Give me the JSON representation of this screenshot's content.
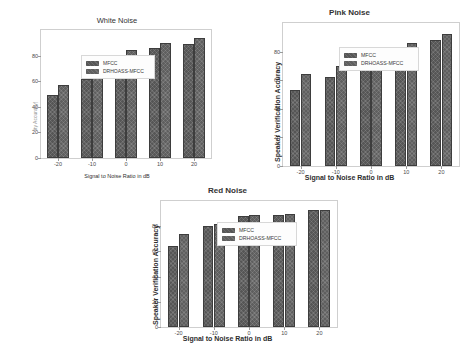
{
  "figure": {
    "background": "#ffffff",
    "bar_color_series1": "#565656",
    "bar_color_series2": "#5f5f5f"
  },
  "charts": [
    {
      "id": "chart1",
      "title": "White Noise",
      "title_bold": false,
      "xlabel": "Signal to Noise Ratio in dB",
      "xlabel_bold": false,
      "ylabel": "ity Accuracy)",
      "ylabel_bold": false,
      "ylabel_faint": true,
      "legend": [
        "MFCC",
        "DRHOASS-MFCC"
      ],
      "yticks": [
        "0",
        "20",
        "40",
        "60",
        "80"
      ],
      "xticks": [
        "-20",
        "-10",
        "0",
        "10",
        "20"
      ]
    },
    {
      "id": "chart2",
      "title": "Pink Noise",
      "title_bold": true,
      "xlabel": "Signal to Noise Ratio in dB",
      "xlabel_bold": true,
      "ylabel": "Speaker Verification Accuracy",
      "ylabel_bold": true,
      "ylabel_faint": false,
      "legend": [
        "MFCC",
        "DRHOASS-MFCC"
      ],
      "yticks": [
        "0",
        "20",
        "40",
        "60",
        "80"
      ],
      "xticks": [
        "-20",
        "-10",
        "0",
        "10",
        "20"
      ]
    },
    {
      "id": "chart3",
      "title": "Red Noise",
      "title_bold": true,
      "xlabel": "Signal to Noise Ratio in dB",
      "xlabel_bold": true,
      "ylabel": "Speaker Verification Accuracy",
      "ylabel_bold": true,
      "ylabel_faint": false,
      "legend": [
        "MFCC",
        "DRHOASS-MFCC"
      ],
      "yticks": [
        "0",
        "20",
        "40",
        "60",
        "80"
      ],
      "xticks": [
        "-20",
        "-10",
        "0",
        "10",
        "20"
      ]
    }
  ],
  "chart_data": [
    {
      "type": "bar",
      "title": "White Noise",
      "xlabel": "Signal to Noise Ratio in dB",
      "ylabel": "Speaker Verification Accuracy",
      "categories": [
        "-20",
        "-10",
        "0",
        "10",
        "20"
      ],
      "series": [
        {
          "name": "MFCC",
          "values": [
            49,
            62,
            80,
            86,
            89
          ]
        },
        {
          "name": "DRHOASS-MFCC",
          "values": [
            57,
            72,
            84,
            90,
            94
          ]
        }
      ],
      "ylim": [
        0,
        100
      ],
      "yticks": [
        0,
        20,
        40,
        60,
        80
      ],
      "grid": false,
      "legend_position": "upper left"
    },
    {
      "type": "bar",
      "title": "Pink Noise",
      "xlabel": "Signal to Noise Ratio in dB",
      "ylabel": "Speaker Verification Accuracy",
      "categories": [
        "-20",
        "-10",
        "0",
        "10",
        "20"
      ],
      "series": [
        {
          "name": "MFCC",
          "values": [
            53,
            62,
            78,
            83,
            88
          ]
        },
        {
          "name": "DRHOASS-MFCC",
          "values": [
            64,
            70,
            83,
            86,
            92
          ]
        }
      ],
      "ylim": [
        0,
        100
      ],
      "yticks": [
        0,
        20,
        40,
        60,
        80
      ],
      "grid": false,
      "legend_position": "upper left"
    },
    {
      "type": "bar",
      "title": "Red Noise",
      "xlabel": "Signal to Noise Ratio in dB",
      "ylabel": "Speaker Verification Accuracy",
      "categories": [
        "-20",
        "-10",
        "0",
        "10",
        "20"
      ],
      "series": [
        {
          "name": "MFCC",
          "values": [
            64,
            80,
            88,
            89,
            93
          ]
        },
        {
          "name": "DRHOASS-MFCC",
          "values": [
            74,
            82,
            89,
            90,
            93
          ]
        }
      ],
      "ylim": [
        0,
        100
      ],
      "yticks": [
        0,
        20,
        40,
        60,
        80
      ],
      "grid": false,
      "legend_position": "upper left"
    }
  ]
}
